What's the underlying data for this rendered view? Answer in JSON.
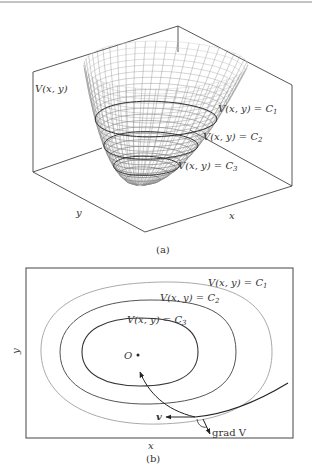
{
  "figure": {
    "panel_a": {
      "caption": "(a)",
      "surface_label": "V(x, y)",
      "level_labels": [
        {
          "lhs": "V(x, y) = C",
          "sub": "1"
        },
        {
          "lhs": "V(x, y) = C",
          "sub": "2"
        },
        {
          "lhs": "V(x, y) = C",
          "sub": "3"
        }
      ],
      "axis_x": "x",
      "axis_y": "y"
    },
    "panel_b": {
      "caption": "(b)",
      "axis_x": "x",
      "axis_y": "y",
      "origin_label": "O",
      "level_labels": [
        {
          "lhs": "V(x, y) = C",
          "sub": "1"
        },
        {
          "lhs": "V(x, y) = C",
          "sub": "2"
        },
        {
          "lhs": "V(x, y) = C",
          "sub": "3"
        }
      ],
      "velocity_label": "v",
      "gradient_label": "grad V"
    },
    "colors": {
      "line": "#333333",
      "outer_contour": "#aaaaaa",
      "mid_contour": "#555555",
      "inner_contour": "#333333"
    }
  }
}
